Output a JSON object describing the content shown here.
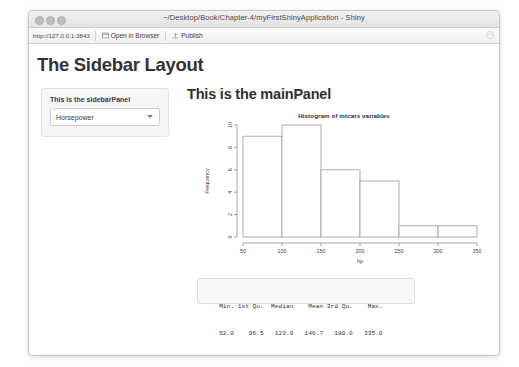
{
  "window": {
    "title": "~/Desktop/Book/Chapter-4/myFirstShinyApplication - Shiny",
    "traffic_lights": [
      "close",
      "minimize",
      "maximize"
    ]
  },
  "toolbar": {
    "url": "http://127.0.0.1:3843",
    "open_in_browser_label": "Open in Browser",
    "publish_label": "Publish",
    "right_icon": "publish-cloud-icon"
  },
  "app": {
    "page_title": "The Sidebar Layout",
    "sidebar": {
      "label": "This is the sidebarPanel",
      "select": {
        "value": "Horsepower",
        "options": [
          "Horsepower"
        ]
      }
    },
    "main": {
      "title": "This is the mainPanel"
    },
    "summary": {
      "headers": [
        "Min.",
        "1st Qu.",
        "Median",
        "Mean",
        "3rd Qu.",
        "Max."
      ],
      "values": [
        "52.0",
        "96.5",
        "123.0",
        "146.7",
        "180.0",
        "335.0"
      ],
      "header_line": "   Min. 1st Qu.  Median    Mean 3rd Qu.    Max. ",
      "value_line": "   52.0    96.5   123.0   146.7   180.0   335.0 "
    }
  },
  "chart_data": {
    "type": "bar",
    "title": "Histogram of mtcars variables",
    "xlabel": "hp",
    "ylabel": "Frequency",
    "categories": [
      "50-100",
      "100-150",
      "150-200",
      "200-250",
      "250-300",
      "300-350"
    ],
    "bin_edges": [
      50,
      100,
      150,
      200,
      250,
      300,
      350
    ],
    "values": [
      9,
      10,
      6,
      5,
      1,
      1
    ],
    "xlim": [
      50,
      350
    ],
    "ylim": [
      0,
      10
    ],
    "xticks": [
      50,
      100,
      150,
      200,
      250,
      300,
      350
    ],
    "yticks": [
      0,
      2,
      4,
      6,
      8,
      10
    ],
    "grid": false,
    "legend": "none",
    "bar_fill": "#ffffff",
    "bar_stroke": "#9a9a9a"
  }
}
